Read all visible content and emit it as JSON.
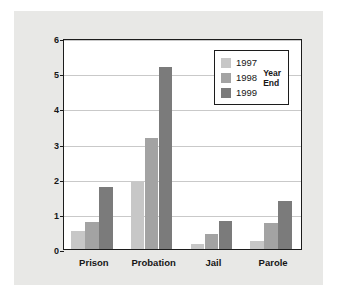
{
  "chart_data": {
    "type": "bar",
    "title": "",
    "xlabel": "",
    "ylabel": "Estimated Projected Population (in millions)",
    "categories": [
      "Prison",
      "Probation",
      "Jail",
      "Parole"
    ],
    "series": [
      {
        "name": "1997",
        "color": "#c7c7c7",
        "values": [
          0.5,
          1.9,
          0.15,
          0.23
        ]
      },
      {
        "name": "1998",
        "color": "#a3a3a3",
        "values": [
          0.78,
          3.17,
          0.44,
          0.74
        ]
      },
      {
        "name": "1999",
        "color": "#7b7b7b",
        "values": [
          1.76,
          5.17,
          0.79,
          1.37
        ]
      }
    ],
    "ylim": [
      0,
      6
    ],
    "yticks": [
      0,
      1,
      2,
      3,
      4,
      5,
      6
    ],
    "ytick_labels": [
      "0",
      "1",
      "2",
      "3",
      "4",
      "5",
      "6"
    ],
    "grid": true,
    "legend_position": "top-right",
    "legend_title": "Year\nEnd"
  },
  "colors": {
    "figure_background": "#e8e8e6",
    "plot_background": "#ffffff",
    "axis": "#1c1c1c",
    "gridline": "#c9c9c9",
    "text": "#161616"
  }
}
